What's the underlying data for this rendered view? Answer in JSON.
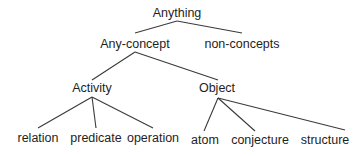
{
  "diagram": {
    "type": "tree",
    "nodes": [
      {
        "id": "anything",
        "label": "Anything",
        "x": 177,
        "y": 13
      },
      {
        "id": "any-concept",
        "label": "Any-concept",
        "x": 135,
        "y": 44
      },
      {
        "id": "non-concepts",
        "label": "non-concepts",
        "x": 242,
        "y": 44
      },
      {
        "id": "activity",
        "label": "Activity",
        "x": 92,
        "y": 88
      },
      {
        "id": "object",
        "label": "Object",
        "x": 217,
        "y": 88
      },
      {
        "id": "relation",
        "label": "relation",
        "x": 38,
        "y": 138
      },
      {
        "id": "predicate",
        "label": "predicate",
        "x": 96,
        "y": 138
      },
      {
        "id": "operation",
        "label": "operation",
        "x": 153,
        "y": 138
      },
      {
        "id": "atom",
        "label": "atom",
        "x": 205,
        "y": 140
      },
      {
        "id": "conjecture",
        "label": "conjecture",
        "x": 260,
        "y": 140
      },
      {
        "id": "structure",
        "label": "structure",
        "x": 325,
        "y": 140
      }
    ],
    "edges": [
      {
        "from": "anything",
        "to": "any-concept",
        "x1": 177,
        "y1": 21,
        "x2": 135,
        "y2": 33
      },
      {
        "from": "anything",
        "to": "non-concepts",
        "x1": 177,
        "y1": 21,
        "x2": 242,
        "y2": 33
      },
      {
        "from": "any-concept",
        "to": "activity",
        "x1": 135,
        "y1": 52,
        "x2": 92,
        "y2": 80
      },
      {
        "from": "any-concept",
        "to": "object",
        "x1": 135,
        "y1": 52,
        "x2": 218,
        "y2": 80
      },
      {
        "from": "activity",
        "to": "relation",
        "x1": 92,
        "y1": 97,
        "x2": 38,
        "y2": 128
      },
      {
        "from": "activity",
        "to": "predicate",
        "x1": 92,
        "y1": 97,
        "x2": 96,
        "y2": 128
      },
      {
        "from": "activity",
        "to": "operation",
        "x1": 92,
        "y1": 97,
        "x2": 153,
        "y2": 128
      },
      {
        "from": "object",
        "to": "atom",
        "x1": 218,
        "y1": 98,
        "x2": 204,
        "y2": 131
      },
      {
        "from": "object",
        "to": "conjecture",
        "x1": 218,
        "y1": 98,
        "x2": 255,
        "y2": 131
      },
      {
        "from": "object",
        "to": "structure",
        "x1": 218,
        "y1": 98,
        "x2": 345,
        "y2": 130
      }
    ],
    "colors": {
      "line": "#3a3a3a",
      "text": "#1e1e1e",
      "background": "#ffffff"
    }
  }
}
